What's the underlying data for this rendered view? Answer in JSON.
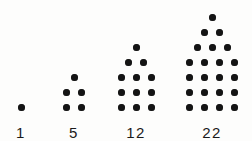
{
  "figure": {
    "background_color": "#fdfdfc",
    "dot_color": "#141414",
    "label_color": "#1a1a1a"
  },
  "chart_data": {
    "type": "bar",
    "title": "",
    "subtitle": "",
    "xlabel": "",
    "ylabel": "",
    "grid": false,
    "legend": null,
    "categories": [
      "1",
      "5",
      "12",
      "22"
    ],
    "values": [
      1,
      5,
      12,
      22
    ],
    "ylim": [
      0,
      22
    ],
    "figures": [
      {
        "id": "figure-1",
        "label": "1",
        "total_dots": 1,
        "rows": [
          1
        ]
      },
      {
        "id": "figure-2",
        "label": "5",
        "total_dots": 5,
        "rows": [
          1,
          2,
          2
        ]
      },
      {
        "id": "figure-3",
        "label": "12",
        "total_dots": 12,
        "rows": [
          1,
          2,
          3,
          3,
          3
        ]
      },
      {
        "id": "figure-4",
        "label": "22",
        "total_dots": 22,
        "rows": [
          1,
          2,
          3,
          4,
          4,
          4,
          4
        ]
      }
    ]
  }
}
